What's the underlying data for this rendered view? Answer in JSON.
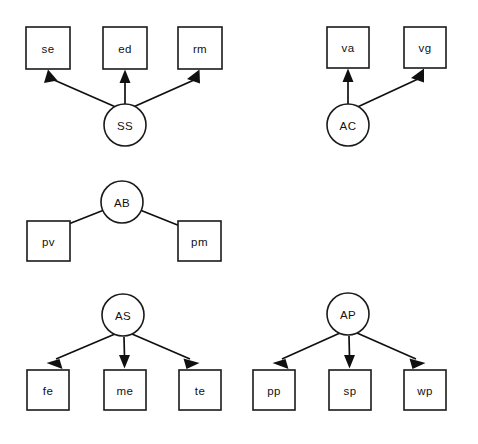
{
  "diagram": {
    "type": "path-diagram",
    "title": "",
    "background_color": "#ffffff",
    "stroke_color": "#101010",
    "node_fill": "#ffffff",
    "groups": [
      {
        "id": "group-ss",
        "latent": {
          "id": "SS",
          "label": "SS",
          "shape": "circle",
          "cx": 125,
          "cy": 125,
          "r": 21
        },
        "indicators": [
          {
            "id": "se",
            "label": "se",
            "shape": "rect",
            "x": 26,
            "y": 27,
            "w": 44,
            "h": 42
          },
          {
            "id": "ed",
            "label": "ed",
            "shape": "rect",
            "x": 103,
            "y": 27,
            "w": 44,
            "h": 42
          },
          {
            "id": "rm",
            "label": "rm",
            "shape": "rect",
            "x": 178,
            "y": 27,
            "w": 44,
            "h": 42
          }
        ],
        "edges": [
          {
            "from": "SS",
            "to": "se",
            "direction": "up-left"
          },
          {
            "from": "SS",
            "to": "ed",
            "direction": "up"
          },
          {
            "from": "SS",
            "to": "rm",
            "direction": "up-right"
          }
        ]
      },
      {
        "id": "group-ac",
        "latent": {
          "id": "AC",
          "label": "AC",
          "shape": "circle",
          "cx": 348,
          "cy": 125,
          "r": 21
        },
        "indicators": [
          {
            "id": "va",
            "label": "va",
            "shape": "rect",
            "x": 327,
            "y": 27,
            "w": 42,
            "h": 41
          },
          {
            "id": "vg",
            "label": "vg",
            "shape": "rect",
            "x": 404,
            "y": 27,
            "w": 42,
            "h": 41
          }
        ],
        "edges": [
          {
            "from": "AC",
            "to": "va",
            "direction": "up"
          },
          {
            "from": "AC",
            "to": "vg",
            "direction": "up-right"
          }
        ]
      },
      {
        "id": "group-ab",
        "latent": {
          "id": "AB",
          "label": "AB",
          "shape": "circle",
          "cx": 122,
          "cy": 202,
          "r": 21
        },
        "indicators": [
          {
            "id": "pv",
            "label": "pv",
            "shape": "rect",
            "x": 27,
            "y": 221,
            "w": 43,
            "h": 40
          },
          {
            "id": "pm",
            "label": "pm",
            "shape": "rect",
            "x": 178,
            "y": 221,
            "w": 43,
            "h": 40
          }
        ],
        "edges": [
          {
            "from": "AB",
            "to": "pv",
            "direction": "down-left"
          },
          {
            "from": "AB",
            "to": "pm",
            "direction": "down-right"
          }
        ]
      },
      {
        "id": "group-as",
        "latent": {
          "id": "AS",
          "label": "AS",
          "shape": "circle",
          "cx": 123,
          "cy": 315,
          "r": 21
        },
        "indicators": [
          {
            "id": "fe",
            "label": "fe",
            "shape": "rect",
            "x": 27,
            "y": 370,
            "w": 42,
            "h": 40
          },
          {
            "id": "me",
            "label": "me",
            "shape": "rect",
            "x": 104,
            "y": 370,
            "w": 42,
            "h": 40
          },
          {
            "id": "te",
            "label": "te",
            "shape": "rect",
            "x": 179,
            "y": 370,
            "w": 42,
            "h": 40
          }
        ],
        "edges": [
          {
            "from": "AS",
            "to": "fe",
            "direction": "down-left"
          },
          {
            "from": "AS",
            "to": "me",
            "direction": "down"
          },
          {
            "from": "AS",
            "to": "te",
            "direction": "down-right"
          }
        ]
      },
      {
        "id": "group-ap",
        "latent": {
          "id": "AP",
          "label": "AP",
          "shape": "circle",
          "cx": 348,
          "cy": 314,
          "r": 21
        },
        "indicators": [
          {
            "id": "pp",
            "label": "pp",
            "shape": "rect",
            "x": 253,
            "y": 370,
            "w": 42,
            "h": 40
          },
          {
            "id": "sp",
            "label": "sp",
            "shape": "rect",
            "x": 329,
            "y": 370,
            "w": 42,
            "h": 40
          },
          {
            "id": "wp",
            "label": "wp",
            "shape": "rect",
            "x": 404,
            "y": 370,
            "w": 42,
            "h": 40
          }
        ],
        "edges": [
          {
            "from": "AP",
            "to": "pp",
            "direction": "down-left"
          },
          {
            "from": "AP",
            "to": "sp",
            "direction": "down"
          },
          {
            "from": "AP",
            "to": "wp",
            "direction": "down-right"
          }
        ]
      }
    ]
  }
}
